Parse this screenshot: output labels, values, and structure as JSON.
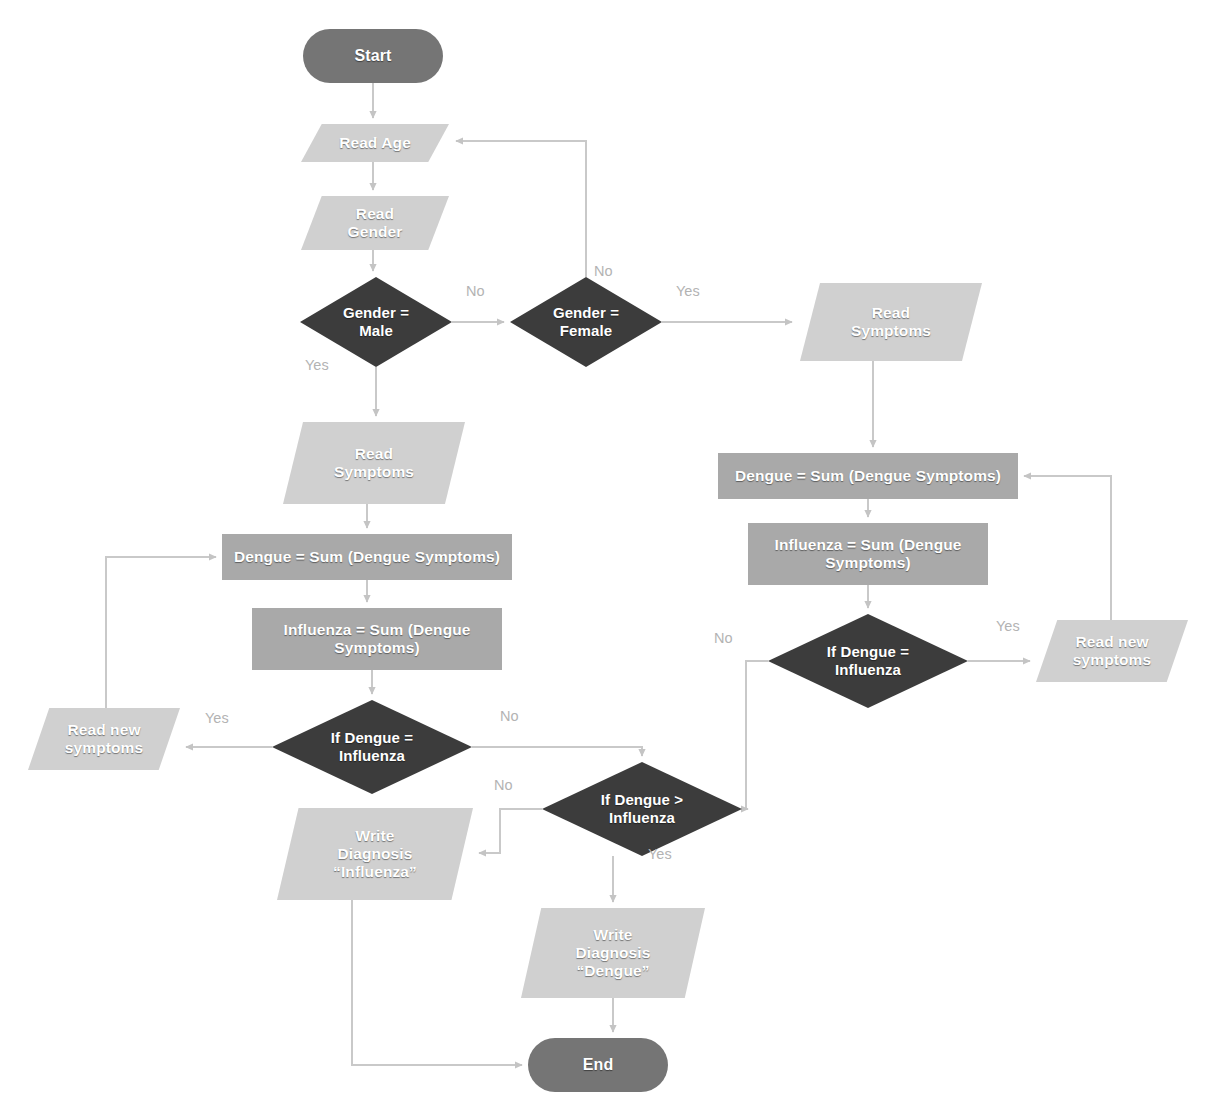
{
  "diagram": {
    "colors": {
      "terminator": "#757575",
      "process": "#a9a9a9",
      "decision": "#3c3c3c",
      "io": "#d0d0d0",
      "connector": "#c9c9c9",
      "label_text": "#b3b3b3",
      "node_text": "#ffffff",
      "background": "#ffffff"
    },
    "nodes": [
      {
        "id": "start",
        "shape": "terminator",
        "label": "Start",
        "x": 303,
        "y": 29,
        "w": 140,
        "h": 54
      },
      {
        "id": "read_age",
        "shape": "io",
        "label": "Read Age",
        "x": 301,
        "y": 124,
        "w": 148,
        "h": 38
      },
      {
        "id": "read_gender",
        "shape": "io",
        "label": "Read\nGender",
        "x": 301,
        "y": 196,
        "w": 148,
        "h": 54
      },
      {
        "id": "gender_male",
        "shape": "decision",
        "label": "Gender =\nMale",
        "x": 300,
        "y": 277,
        "w": 152,
        "h": 90
      },
      {
        "id": "gender_female",
        "shape": "decision",
        "label": "Gender =\nFemale",
        "x": 510,
        "y": 277,
        "w": 152,
        "h": 90
      },
      {
        "id": "read_sym_r",
        "shape": "io",
        "label": "Read\nSymptoms",
        "x": 800,
        "y": 283,
        "w": 182,
        "h": 78
      },
      {
        "id": "read_sym_l",
        "shape": "io",
        "label": "Read\nSymptoms",
        "x": 283,
        "y": 422,
        "w": 182,
        "h": 82
      },
      {
        "id": "dengue_sum_r",
        "shape": "process",
        "label": "Dengue = Sum (Dengue Symptoms)",
        "x": 718,
        "y": 453,
        "w": 300,
        "h": 46
      },
      {
        "id": "influ_sum_r",
        "shape": "process",
        "label": "Influenza = Sum (Dengue\nSymptoms)",
        "x": 748,
        "y": 523,
        "w": 240,
        "h": 62
      },
      {
        "id": "dengue_sum_l",
        "shape": "process",
        "label": "Dengue = Sum (Dengue Symptoms)",
        "x": 222,
        "y": 534,
        "w": 290,
        "h": 46
      },
      {
        "id": "influ_sum_l",
        "shape": "process",
        "label": "Influenza = Sum (Dengue\nSymptoms)",
        "x": 252,
        "y": 608,
        "w": 250,
        "h": 62
      },
      {
        "id": "dec_eq_r",
        "shape": "decision",
        "label": "If Dengue =\nInfluenza",
        "x": 768,
        "y": 614,
        "w": 200,
        "h": 94
      },
      {
        "id": "dec_eq_l",
        "shape": "decision",
        "label": "If Dengue =\nInfluenza",
        "x": 272,
        "y": 700,
        "w": 200,
        "h": 94
      },
      {
        "id": "read_new_r",
        "shape": "io",
        "label": "Read new\nsymptoms",
        "x": 1036,
        "y": 620,
        "w": 152,
        "h": 62
      },
      {
        "id": "read_new_l",
        "shape": "io",
        "label": "Read new\nsymptoms",
        "x": 28,
        "y": 708,
        "w": 152,
        "h": 62
      },
      {
        "id": "dec_gt",
        "shape": "decision",
        "label": "If Dengue >\nInfluenza",
        "x": 542,
        "y": 762,
        "w": 200,
        "h": 94
      },
      {
        "id": "write_influ",
        "shape": "io",
        "label": "Write\nDiagnosis\n“Influenza”",
        "x": 277,
        "y": 808,
        "w": 196,
        "h": 92
      },
      {
        "id": "write_dengue",
        "shape": "io",
        "label": "Write\nDiagnosis\n“Dengue”",
        "x": 521,
        "y": 908,
        "w": 184,
        "h": 90
      },
      {
        "id": "end",
        "shape": "terminator",
        "label": "End",
        "x": 528,
        "y": 1038,
        "w": 140,
        "h": 54
      }
    ],
    "edge_labels": [
      {
        "id": "lbl-male-no",
        "text": "No",
        "x": 466,
        "y": 283
      },
      {
        "id": "lbl-male-yes",
        "text": "Yes",
        "x": 305,
        "y": 357
      },
      {
        "id": "lbl-female-no",
        "text": "No",
        "x": 594,
        "y": 263
      },
      {
        "id": "lbl-female-yes",
        "text": "Yes",
        "x": 676,
        "y": 283
      },
      {
        "id": "lbl-eql-yes",
        "text": "Yes",
        "x": 205,
        "y": 710
      },
      {
        "id": "lbl-eql-no",
        "text": "No",
        "x": 500,
        "y": 708
      },
      {
        "id": "lbl-eqr-no",
        "text": "No",
        "x": 714,
        "y": 630
      },
      {
        "id": "lbl-eqr-yes",
        "text": "Yes",
        "x": 996,
        "y": 618
      },
      {
        "id": "lbl-gt-no",
        "text": "No",
        "x": 494,
        "y": 777
      },
      {
        "id": "lbl-gt-yes",
        "text": "Yes",
        "x": 648,
        "y": 846
      }
    ],
    "edges": [
      {
        "id": "e-start-readage",
        "from": "start",
        "to": "read_age",
        "label": ""
      },
      {
        "id": "e-readage-readgender",
        "from": "read_age",
        "to": "read_gender",
        "label": ""
      },
      {
        "id": "e-readgender-male",
        "from": "read_gender",
        "to": "gender_male",
        "label": ""
      },
      {
        "id": "e-male-female",
        "from": "gender_male",
        "to": "gender_female",
        "label": "No"
      },
      {
        "id": "e-male-readsym",
        "from": "gender_male",
        "to": "read_sym_l",
        "label": "Yes"
      },
      {
        "id": "e-female-readage",
        "from": "gender_female",
        "to": "read_age",
        "label": "No"
      },
      {
        "id": "e-female-readsymr",
        "from": "gender_female",
        "to": "read_sym_r",
        "label": "Yes"
      },
      {
        "id": "e-readsymr-dsumr",
        "from": "read_sym_r",
        "to": "dengue_sum_r",
        "label": ""
      },
      {
        "id": "e-dsumr-isumr",
        "from": "dengue_sum_r",
        "to": "influ_sum_r",
        "label": ""
      },
      {
        "id": "e-isumr-eqr",
        "from": "influ_sum_r",
        "to": "dec_eq_r",
        "label": ""
      },
      {
        "id": "e-eqr-readnewr",
        "from": "dec_eq_r",
        "to": "read_new_r",
        "label": "Yes"
      },
      {
        "id": "e-readnewr-dsumr",
        "from": "read_new_r",
        "to": "dengue_sum_r",
        "label": ""
      },
      {
        "id": "e-eqr-gt",
        "from": "dec_eq_r",
        "to": "dec_gt",
        "label": "No"
      },
      {
        "id": "e-readsyml-dsuml",
        "from": "read_sym_l",
        "to": "dengue_sum_l",
        "label": ""
      },
      {
        "id": "e-dsuml-isuml",
        "from": "dengue_sum_l",
        "to": "influ_sum_l",
        "label": ""
      },
      {
        "id": "e-isuml-eql",
        "from": "influ_sum_l",
        "to": "dec_eq_l",
        "label": ""
      },
      {
        "id": "e-eql-readnewl",
        "from": "dec_eq_l",
        "to": "read_new_l",
        "label": "Yes"
      },
      {
        "id": "e-readnewl-dsuml",
        "from": "read_new_l",
        "to": "dengue_sum_l",
        "label": ""
      },
      {
        "id": "e-eql-gt",
        "from": "dec_eq_l",
        "to": "dec_gt",
        "label": "No"
      },
      {
        "id": "e-gt-writeinflu",
        "from": "dec_gt",
        "to": "write_influ",
        "label": "No"
      },
      {
        "id": "e-gt-writedengue",
        "from": "dec_gt",
        "to": "write_dengue",
        "label": "Yes"
      },
      {
        "id": "e-writedengue-end",
        "from": "write_dengue",
        "to": "end",
        "label": ""
      },
      {
        "id": "e-writeinflu-end",
        "from": "write_influ",
        "to": "end",
        "label": ""
      }
    ]
  }
}
